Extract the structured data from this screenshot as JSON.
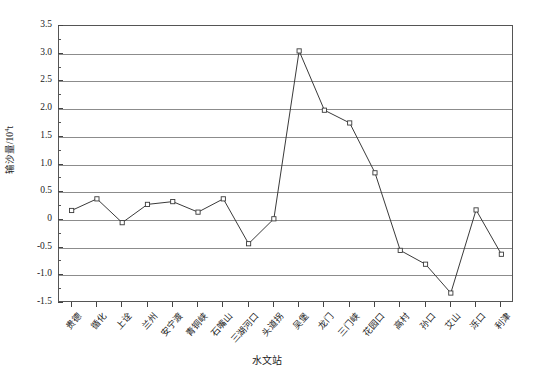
{
  "chart_data": {
    "type": "line",
    "title": "",
    "xlabel": "水文站",
    "ylabel": "输沙量/10⁴t",
    "ylabel_main": "输沙量/10",
    "ylabel_sup": "4",
    "ylabel_unit": "t",
    "ylim": [
      -1.5,
      3.5
    ],
    "ytick_values": [
      3.5,
      3.0,
      2.5,
      2.0,
      1.5,
      1.0,
      0.5,
      0,
      -0.5,
      -1.0,
      -1.5
    ],
    "ytick_labels": [
      "3.5",
      "3.0",
      "2.5",
      "2.0",
      "1.5",
      "1.0",
      "0.5",
      "0",
      "-0.5",
      "-1.0",
      "-1.5"
    ],
    "grid": true,
    "grid_axis": "y",
    "legend": false,
    "marker": "open-square",
    "line_color": "#3a3a3a",
    "grid_color": "#8c8c8c",
    "categories": [
      "贵德",
      "循化",
      "上诠",
      "兰州",
      "安宁渡",
      "青铜峡",
      "石嘴山",
      "三湖河口",
      "头道拐",
      "吴堡",
      "龙门",
      "三门峡",
      "花园口",
      "高村",
      "孙口",
      "艾山",
      "泺口",
      "利津"
    ],
    "values": [
      0.17,
      0.38,
      -0.05,
      0.28,
      0.33,
      0.14,
      0.38,
      -0.43,
      0.02,
      3.05,
      1.98,
      1.75,
      0.85,
      -0.55,
      -0.8,
      -1.32,
      0.18,
      -0.62
    ]
  }
}
